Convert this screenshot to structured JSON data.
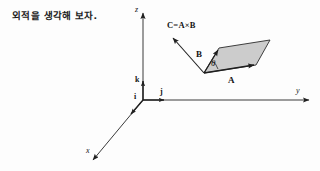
{
  "caption": {
    "text": "외적을 생각해 보자."
  },
  "figure": {
    "name": "cross-product-diagram",
    "axes": [
      {
        "id": "z",
        "label": "z"
      },
      {
        "id": "y",
        "label": "y"
      },
      {
        "id": "x",
        "label": "x"
      }
    ],
    "unit_vectors": [
      {
        "id": "k",
        "label": "k"
      },
      {
        "id": "j",
        "label": "j"
      },
      {
        "id": "i",
        "label": "i"
      }
    ],
    "vectors": [
      {
        "id": "A",
        "label": "A"
      },
      {
        "id": "B",
        "label": "B"
      },
      {
        "id": "C",
        "label": "C=A×B"
      }
    ],
    "angle": {
      "id": "theta",
      "label": "θ"
    },
    "parallelogram": {
      "fill": "#c9c9c9",
      "stroke": "#2b2b2b"
    },
    "colors": {
      "background": "#fdfdfd",
      "ink": "#1a1a1a",
      "axis": "#3a3a3a"
    }
  }
}
